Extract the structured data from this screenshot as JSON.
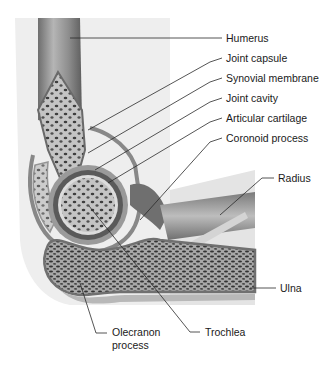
{
  "diagram": {
    "labels": [
      {
        "id": "humerus",
        "text": "Humerus",
        "x": 226,
        "y": 42,
        "line": [
          [
            70,
            38
          ],
          [
            222,
            38
          ]
        ]
      },
      {
        "id": "joint-capsule",
        "text": "Joint capsule",
        "x": 226,
        "y": 61,
        "line": [
          [
            88,
            130
          ],
          [
            210,
            62
          ],
          [
            222,
            58
          ]
        ]
      },
      {
        "id": "synovial-membrane",
        "text": "Synovial membrane",
        "x": 226,
        "y": 82,
        "line": [
          [
            88,
            153
          ],
          [
            210,
            82
          ],
          [
            222,
            78
          ]
        ]
      },
      {
        "id": "joint-cavity",
        "text": "Joint cavity",
        "x": 226,
        "y": 102,
        "line": [
          [
            95,
            170
          ],
          [
            210,
            102
          ],
          [
            222,
            98
          ]
        ]
      },
      {
        "id": "articular-cartilage",
        "text": "Articular cartilage",
        "x": 226,
        "y": 121,
        "line": [
          [
            108,
            183
          ],
          [
            210,
            122
          ],
          [
            222,
            118
          ]
        ]
      },
      {
        "id": "coronoid-process",
        "text": "Coronoid process",
        "x": 226,
        "y": 141,
        "line": [
          [
            140,
            220
          ],
          [
            210,
            142
          ],
          [
            222,
            138
          ]
        ]
      },
      {
        "id": "radius",
        "text": "Radius",
        "x": 278,
        "y": 182,
        "line": [
          [
            220,
            215
          ],
          [
            262,
            178
          ],
          [
            274,
            178
          ]
        ]
      },
      {
        "id": "ulna",
        "text": "Ulna",
        "x": 280,
        "y": 292,
        "line": [
          [
            250,
            288
          ],
          [
            276,
            288
          ]
        ]
      },
      {
        "id": "trochlea",
        "text": "Trochlea",
        "x": 205,
        "y": 336,
        "line": [
          [
            89,
            206
          ],
          [
            190,
            332
          ],
          [
            200,
            332
          ]
        ]
      },
      {
        "id": "olecranon-process",
        "text": "Olecranon",
        "text2": "process",
        "x": 112,
        "y": 336,
        "line": [
          [
            80,
            283
          ],
          [
            96,
            333
          ],
          [
            107,
            333
          ]
        ]
      }
    ],
    "colors": {
      "background": "#ffffff",
      "skin": "#ececec",
      "bone_shaft": "#9a9a9a",
      "spongy_bone": "#c8c8c8",
      "cartilage": "#7e7e7e",
      "muscle": "#6f6f6f",
      "leader_line": "#2a2a2a",
      "label_text": "#1a1a1a"
    }
  }
}
